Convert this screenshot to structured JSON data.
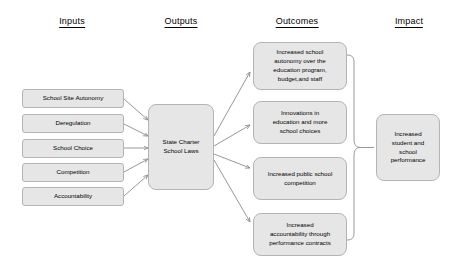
{
  "diagram": {
    "background": "#ffffff",
    "node_fill": "#e6e6e6",
    "node_border": "#b4b4b4",
    "connector_color": "#8c8c8c"
  },
  "columns": [
    {
      "id": "inputs",
      "label": "Inputs"
    },
    {
      "id": "outputs",
      "label": "Outputs"
    },
    {
      "id": "outcomes",
      "label": "Outcomes"
    },
    {
      "id": "impact",
      "label": "Impact"
    }
  ],
  "inputs": [
    {
      "label": "School Site Autonomy"
    },
    {
      "label": "Deregulation"
    },
    {
      "label": "School Choice"
    },
    {
      "label": "Competition"
    },
    {
      "label": "Accountability"
    }
  ],
  "outputs": [
    {
      "label": "State Charter\nSchool Laws"
    }
  ],
  "outcomes": [
    {
      "label": "Increased school\nautonomy over the\neducation program,\nbudget,and staff"
    },
    {
      "label": "Innovations in\neducation and more\nschool choices"
    },
    {
      "label": "Increased public school\ncompetition"
    },
    {
      "label": "Increased\naccountability through\nperformance contracts"
    }
  ],
  "impact": [
    {
      "label": "Increased\nstudent and\nschool\nperformance"
    }
  ]
}
